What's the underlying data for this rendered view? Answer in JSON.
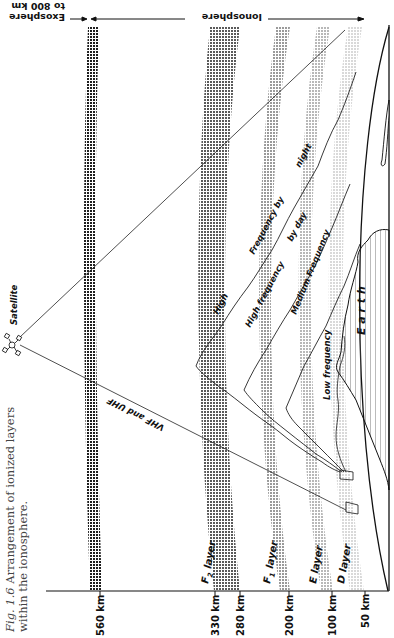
{
  "caption": {
    "fig_number": "Fig. 1.6",
    "text": "Arrangement of ionized layers within the ionosphere."
  },
  "top_labels": {
    "exosphere_line1": "Exosphere",
    "exosphere_line2": "to 800 km",
    "ionosphere": "Ionosphere"
  },
  "satellite": {
    "label": "Satellite"
  },
  "signals": {
    "vhf_uhf": "VHF and UHF",
    "high_frequency_by_night_1": "High",
    "high_frequency_by_night_2": "Frequency by",
    "high_frequency_by_night_3": "night",
    "high_frequency_by_day_1": "High frequency",
    "high_frequency_by_day_2": "by day",
    "medium_frequency": "Medium Frequency",
    "low_frequency": "Low frequency"
  },
  "earth": {
    "label": "E a r t h"
  },
  "layers": [
    {
      "name": "F2 layer",
      "label_main": "F",
      "label_sub": "2",
      "label_rest": " layer",
      "color": "#3a3a3a"
    },
    {
      "name": "F1 layer",
      "label_main": "F",
      "label_sub": "1",
      "label_rest": " layer",
      "color": "#8a8a8a"
    },
    {
      "name": "E layer",
      "label_main": "E layer",
      "color": "#b4b4b4"
    },
    {
      "name": "D layer",
      "label_main": "D layer",
      "color": "#e2e2e2"
    }
  ],
  "top_band": {
    "name": "Exosphere band",
    "color": "#2e2e2e"
  },
  "axis": {
    "ticks": [
      {
        "label": "560 km",
        "x": 100
      },
      {
        "label": "330 km",
        "x": 215
      },
      {
        "label": "280 km",
        "x": 240
      },
      {
        "label": "200 km",
        "x": 289
      },
      {
        "label": "100 km",
        "x": 332
      },
      {
        "label": "50 km",
        "x": 365
      }
    ]
  }
}
